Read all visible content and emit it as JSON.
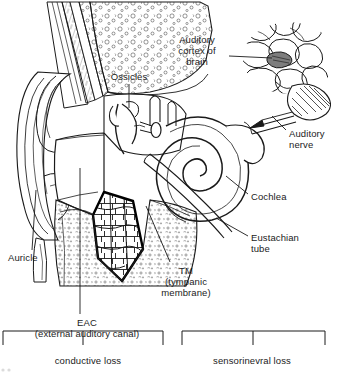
{
  "figure": {
    "kind": "line-art medical illustration",
    "palette": {
      "ink": "#1a1a1a",
      "background": "#ffffff",
      "shading": "#555555"
    }
  },
  "labels": {
    "auditory_cortex": "Auditory\ncortex of\nbrain",
    "ossicles": "Ossicles",
    "auditory_nerve": "Auditory\nnerve",
    "cochlea": "Cochlea",
    "eustachian_tube": "Eustachian\ntube",
    "auricle": "Auricle",
    "tympanic_membrane": "TM\n(tympanic\nmembrane)",
    "eac": "EAC\n(external auditory canal)"
  },
  "brackets": [
    {
      "id": "conductive",
      "caption": "conductive loss"
    },
    {
      "id": "sensorineural",
      "caption": "sensorinevral loss"
    }
  ],
  "structures": [
    "auricle",
    "external auditory canal",
    "tympanic membrane",
    "ossicles",
    "cochlea",
    "auditory nerve",
    "eustachian tube",
    "auditory cortex of brain"
  ]
}
